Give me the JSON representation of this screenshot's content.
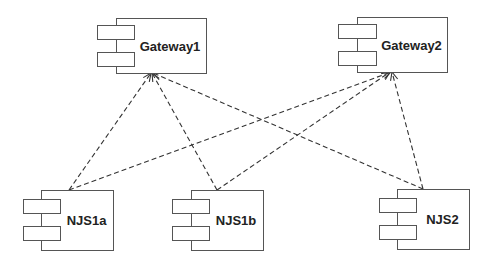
{
  "diagram": {
    "type": "uml-component-diagram",
    "colors": {
      "stroke": "#555555",
      "line": "#333333",
      "text": "#222222",
      "background": "#ffffff"
    },
    "components": [
      {
        "id": "gateway1",
        "label": "Gateway1",
        "x": 116,
        "y": 18,
        "w": 90,
        "h": 55,
        "tab_x": 97,
        "tab_w": 37,
        "tab_h": 14,
        "tab_y1": 25,
        "tab_y2": 52
      },
      {
        "id": "gateway2",
        "label": "Gateway2",
        "x": 357,
        "y": 17,
        "w": 90,
        "h": 55,
        "tab_x": 338,
        "tab_w": 38,
        "tab_h": 14,
        "tab_y1": 24,
        "tab_y2": 51
      },
      {
        "id": "njs1a",
        "label": "NJS1a",
        "x": 41,
        "y": 190,
        "w": 72,
        "h": 60,
        "tab_x": 23,
        "tab_w": 37,
        "tab_h": 14,
        "tab_y1": 199,
        "tab_y2": 226
      },
      {
        "id": "njs1b",
        "label": "NJS1b",
        "x": 191,
        "y": 190,
        "w": 72,
        "h": 60,
        "tab_x": 172,
        "tab_w": 37,
        "tab_h": 14,
        "tab_y1": 199,
        "tab_y2": 226
      },
      {
        "id": "njs2",
        "label": "NJS2",
        "x": 397,
        "y": 189,
        "w": 72,
        "h": 60,
        "tab_x": 379,
        "tab_w": 37,
        "tab_h": 14,
        "tab_y1": 198,
        "tab_y2": 225
      }
    ],
    "dependencies": [
      {
        "from": "njs1a",
        "to": "gateway1",
        "x1": 69,
        "y1": 190,
        "x2": 151,
        "y2": 73,
        "style": "dashed",
        "arrow": "open"
      },
      {
        "from": "njs1a",
        "to": "gateway2",
        "x1": 69,
        "y1": 190,
        "x2": 391,
        "y2": 72,
        "style": "dashed",
        "arrow": "open"
      },
      {
        "from": "njs1b",
        "to": "gateway1",
        "x1": 217,
        "y1": 190,
        "x2": 152,
        "y2": 73,
        "style": "dashed",
        "arrow": "open"
      },
      {
        "from": "njs1b",
        "to": "gateway2",
        "x1": 217,
        "y1": 190,
        "x2": 390,
        "y2": 72,
        "style": "dashed",
        "arrow": "open"
      },
      {
        "from": "njs2",
        "to": "gateway1",
        "x1": 423,
        "y1": 189,
        "x2": 153,
        "y2": 73,
        "style": "dashed",
        "arrow": "open"
      },
      {
        "from": "njs2",
        "to": "gateway2",
        "x1": 423,
        "y1": 189,
        "x2": 392,
        "y2": 72,
        "style": "dashed",
        "arrow": "open"
      }
    ]
  }
}
